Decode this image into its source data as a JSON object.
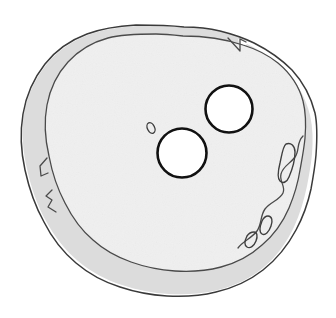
{
  "figure": {
    "caption": "",
    "background_color": "#ffffff",
    "canvas": {
      "width": 336,
      "height": 318
    }
  },
  "colors": {
    "background": "#ffffff",
    "rim_fill": "#dcdcdc",
    "body_fill": "#f0f0f0",
    "void_fill": "#ffffff",
    "outline_stroke": "#3a3a3a",
    "inner_stroke": "#4a4a4a",
    "void_stroke": "#111111",
    "inclusion_stroke": "#3f3f3f"
  },
  "shape": {
    "name": "rounded-irregular-grain",
    "description": "Irregular near-circular outline with a narrow darker cortex band and a lighter interior matrix",
    "outer_outline_path": "M 184 27 C 214 28 240 34 262 45 C 284 56 300 73 309 95 C 318 118 316 144 313 166 C 310 189 304 211 293 231 C 281 252 263 270 241 281 C 218 292 192 294 168 293 C 143 292 118 287 96 276 C 74 265 55 248 43 226 C 31 204 24 180 22 156 C 21 131 25 106 37 84 C 49 62 68 46 91 37 C 114 29 154 27 184 27 Z",
    "inner_outline_path": "M 183 36 C 211 37 236 42 256 52 C 276 62 291 77 299 97 C 307 117 305 140 303 160 C 300 181 295 201 285 219 C 274 238 258 254 238 264 C 217 274 194 276 172 275 C 149 274 126 270 106 260 C 86 250 69 235 58 215 C 47 195 41 173 39 151 C 38 128 42 106 53 86 C 64 67 81 52 102 44 C 123 36 156 35 183 36 Z",
    "extents": {
      "left": 22,
      "top": 27,
      "right": 316,
      "bottom": 294
    }
  },
  "features": {
    "voids": [
      {
        "name": "upper-right-void",
        "cx": 229,
        "cy": 109,
        "r": 23.5,
        "fill": "#ffffff"
      },
      {
        "name": "lower-left-void",
        "cx": 182,
        "cy": 153,
        "r": 24.5,
        "fill": "#ffffff"
      }
    ],
    "inclusions": [
      {
        "name": "small-oval-inclusion",
        "cx": 151,
        "cy": 128,
        "rx": 3.6,
        "ry": 5.6,
        "rotation": -25
      },
      {
        "name": "right-upper-elongate-inclusion",
        "cx": 292,
        "cy": 160,
        "rx": 5,
        "ry": 18,
        "rotation": 20
      },
      {
        "name": "lower-right-elongate-inclusion-a",
        "cx": 264,
        "cy": 225,
        "rx": 4.5,
        "ry": 9,
        "rotation": 28
      },
      {
        "name": "lower-right-elongate-inclusion-b",
        "cx": 250,
        "cy": 240,
        "rx": 4.5,
        "ry": 8,
        "rotation": 35
      }
    ],
    "notches": [
      {
        "name": "top-right-spike-notch",
        "x": 238,
        "y": 40,
        "description": "Narrow inward spike in the cortex band near the upper right margin"
      },
      {
        "name": "left-hook-notch",
        "x": 40,
        "y": 172,
        "description": "Small hooked indentation along the left margin"
      }
    ]
  }
}
